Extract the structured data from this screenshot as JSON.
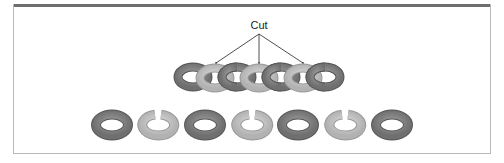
{
  "figure": {
    "label": "Cut",
    "colors": {
      "frame_top_bar": "#6e6e6e",
      "frame_border": "#b8b8b8",
      "dark_ring": "#8a8a8a",
      "dark_ring_edge": "#555555",
      "light_ring": "#c9c9c9",
      "light_ring_edge": "#9a9a9a",
      "leader_line": "#222222"
    },
    "chain": {
      "ring_count": 7,
      "ring_types": [
        "dark",
        "light",
        "dark",
        "light",
        "dark",
        "light",
        "dark"
      ],
      "cut_rings": [
        2,
        4,
        6
      ]
    },
    "separated_rings": {
      "ring_count": 7,
      "ring_types": [
        "dark",
        "light-open",
        "dark",
        "light-open",
        "dark",
        "light-open",
        "dark"
      ]
    }
  }
}
